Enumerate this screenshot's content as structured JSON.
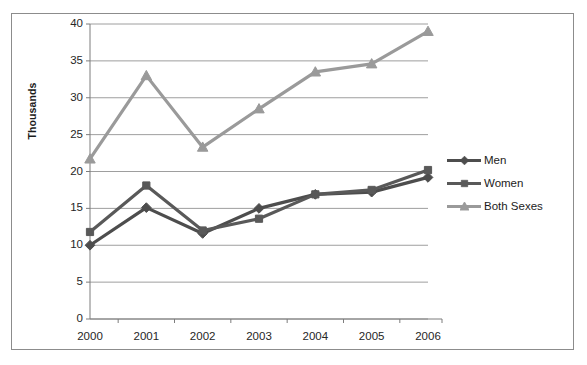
{
  "chart_data": {
    "type": "line",
    "title": "",
    "subtitle": "",
    "xlabel": "",
    "ylabel": "Thousands",
    "categories": [
      "2000",
      "2001",
      "2002",
      "2003",
      "2004",
      "2005",
      "2006"
    ],
    "x": [
      2000,
      2001,
      2002,
      2003,
      2004,
      2005,
      2006
    ],
    "ylim": [
      0,
      40
    ],
    "ytick_interval": 5,
    "yticks": [
      "40",
      "35",
      "30",
      "25",
      "20",
      "15",
      "10",
      "5",
      "0"
    ],
    "ytick_values": [
      40,
      35,
      30,
      25,
      20,
      15,
      10,
      5,
      0
    ],
    "grid": "horizontal",
    "legend_position": "right",
    "series": [
      {
        "name": "Men",
        "marker": "diamond",
        "color": "#4d4d4d",
        "values": [
          10.0,
          15.1,
          11.6,
          15.0,
          16.9,
          17.2,
          19.2
        ]
      },
      {
        "name": "Women",
        "marker": "square",
        "color": "#595959",
        "values": [
          11.8,
          18.1,
          12.0,
          13.6,
          16.9,
          17.5,
          20.2
        ]
      },
      {
        "name": "Both Sexes",
        "marker": "triangle",
        "color": "#9a9a9a",
        "values": [
          21.7,
          33.0,
          23.3,
          28.5,
          33.5,
          34.6,
          39.0
        ]
      }
    ]
  },
  "legend": {
    "items": [
      {
        "label": "Men",
        "color": "#4d4d4d",
        "marker": "diamond"
      },
      {
        "label": "Women",
        "color": "#595959",
        "marker": "square"
      },
      {
        "label": "Both Sexes",
        "color": "#9a9a9a",
        "marker": "triangle"
      }
    ]
  },
  "colors": {
    "men": "#4d4d4d",
    "women": "#595959",
    "both_sexes": "#9a9a9a",
    "gridline": "#9e9e9e",
    "axis": "#7d7d7d",
    "frame": "#8c8c8c",
    "text": "#262626",
    "background": "#ffffff"
  }
}
